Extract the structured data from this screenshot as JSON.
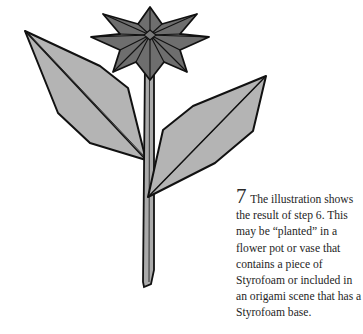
{
  "illustration": {
    "subject": "origami-flower",
    "parts": [
      "flower-head",
      "stem",
      "left-leaf",
      "right-leaf"
    ],
    "colors": {
      "flower": "#6e6e6e",
      "flower_dark": "#5a5a5a",
      "leaf": "#b4b4b4",
      "stem": "#aaaaaa",
      "outline": "#111111"
    }
  },
  "caption": {
    "step_number": "7",
    "text": " The illustration shows the result of step 6. This may be “planted” in a flower pot or vase that contains a piece of Styrofoam or included in an origami scene that has a Styrofoam base."
  }
}
